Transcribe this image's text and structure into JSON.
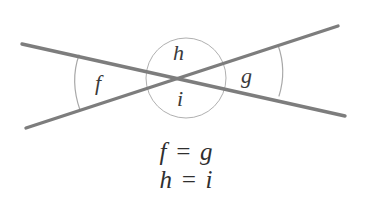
{
  "figure": {
    "kind": "geometry-diagram",
    "background_color": "#ffffff",
    "width": 373,
    "height": 214
  },
  "colors": {
    "line_stroke": "#7d7d7d",
    "arc_stroke": "#a8a8a8",
    "circle_stroke": "#b0b0b0",
    "label_text": "#3a3a3a",
    "equation_text": "#2f2f2f"
  },
  "geometry": {
    "intersection": {
      "x": 185,
      "y": 78
    },
    "lines": [
      {
        "name": "line-descending",
        "x1": 22,
        "y1": 44,
        "x2": 345,
        "y2": 116,
        "stroke_width": 3.4
      },
      {
        "name": "line-ascending",
        "x1": 26,
        "y1": 128,
        "x2": 338,
        "y2": 26,
        "stroke_width": 3.4
      }
    ],
    "circle": {
      "name": "vertical-angle-circle",
      "cx": 186,
      "cy": 78,
      "r": 40,
      "stroke_width": 1
    },
    "arcs": [
      {
        "name": "arc-f",
        "side": "left",
        "path": "M 79 55 C 73 72, 73 90, 80 110",
        "stroke_width": 1.2
      },
      {
        "name": "arc-g",
        "side": "right",
        "path": "M 278 45 C 284 62, 284 80, 279 96",
        "stroke_width": 1.2
      }
    ]
  },
  "labels": {
    "f": "f",
    "g": "g",
    "h": "h",
    "i": "i"
  },
  "equations": [
    "f = g",
    "h = i"
  ]
}
